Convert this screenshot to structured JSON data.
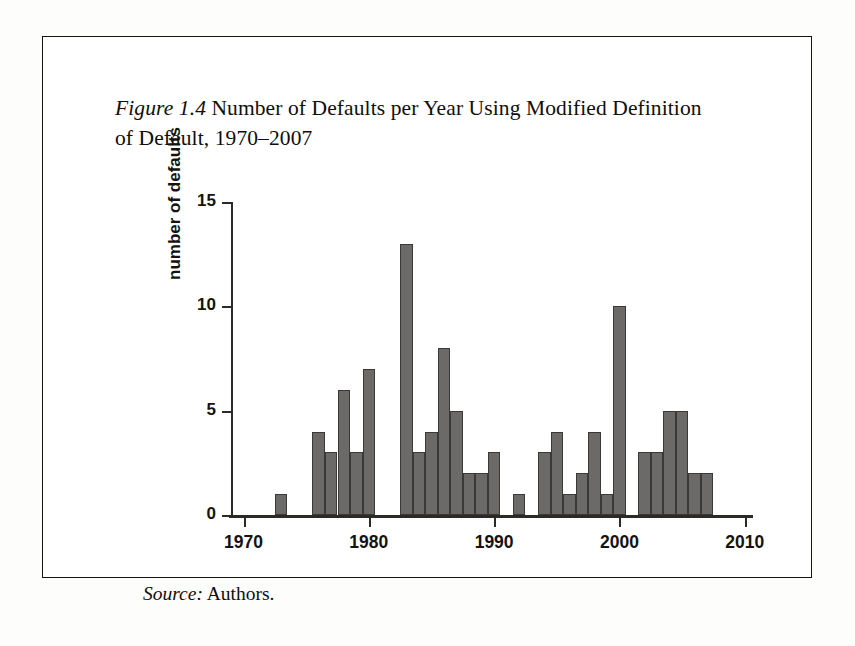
{
  "figure": {
    "label": "Figure",
    "number": "1.4",
    "caption": " Number of Defaults per Year Using Modified Definition of Default, 1970–2007",
    "source_label": "Source:",
    "source_text": " Authors."
  },
  "colors": {
    "bar_fill": "#6b6a68",
    "bar_edge": "#3a3935",
    "axis": "#2c2a26",
    "text": "#141310",
    "frame": "#16140f",
    "page": "#ffffff"
  },
  "chart_data": {
    "type": "bar",
    "xlabel": "",
    "ylabel": "number of defaults",
    "xlim": [
      1969,
      2010.5
    ],
    "ylim": [
      0,
      15
    ],
    "grid": false,
    "legend": null,
    "ytick_labels": [
      "0",
      "5",
      "10",
      "15"
    ],
    "yticks": [
      0,
      5,
      10,
      15
    ],
    "xtick_labels": [
      "1970",
      "1980",
      "1990",
      "2000",
      "2010"
    ],
    "xticks": [
      1970,
      1980,
      1990,
      2000,
      2010
    ],
    "categories": [
      "1970",
      "1971",
      "1972",
      "1973",
      "1974",
      "1975",
      "1976",
      "1977",
      "1978",
      "1979",
      "1980",
      "1981",
      "1982",
      "1983",
      "1984",
      "1985",
      "1986",
      "1987",
      "1988",
      "1989",
      "1990",
      "1991",
      "1992",
      "1993",
      "1994",
      "1995",
      "1996",
      "1997",
      "1998",
      "1999",
      "2000",
      "2001",
      "2002",
      "2003",
      "2004",
      "2005",
      "2006",
      "2007"
    ],
    "values": [
      0,
      0,
      0,
      1,
      0,
      0,
      4,
      3,
      6,
      3,
      7,
      0,
      0,
      13,
      3,
      4,
      8,
      5,
      2,
      2,
      3,
      0,
      1,
      0,
      3,
      4,
      1,
      2,
      4,
      1,
      10,
      0,
      3,
      3,
      5,
      5,
      2,
      2
    ]
  }
}
